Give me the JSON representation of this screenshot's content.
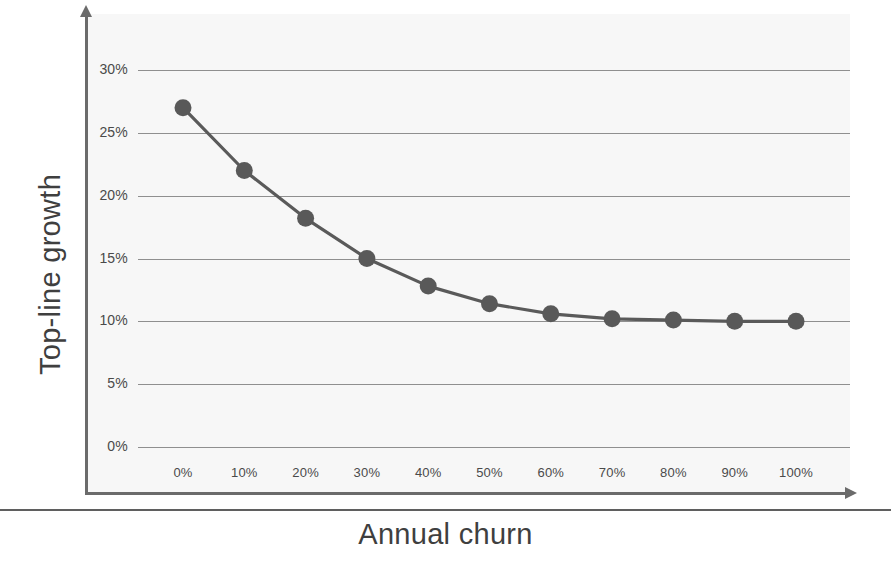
{
  "chart_data": {
    "type": "line",
    "title": "",
    "xlabel": "Annual churn",
    "ylabel": "Top-line growth",
    "categories": [
      "0%",
      "10%",
      "20%",
      "30%",
      "40%",
      "50%",
      "60%",
      "70%",
      "80%",
      "90%",
      "100%"
    ],
    "x": [
      0,
      10,
      20,
      30,
      40,
      50,
      60,
      70,
      80,
      90,
      100
    ],
    "values": [
      27.0,
      22.0,
      18.2,
      15.0,
      12.8,
      11.4,
      10.6,
      10.2,
      10.1,
      10.0,
      10.0
    ],
    "xlim": [
      0,
      100
    ],
    "ylim": [
      0,
      30
    ],
    "ytick_labels": [
      "0%",
      "5%",
      "10%",
      "15%",
      "20%",
      "25%",
      "30%"
    ],
    "ytick_values": [
      0,
      5,
      10,
      15,
      20,
      25,
      30
    ],
    "grid": "horizontal",
    "legend": "none",
    "series": [
      {
        "name": "Top-line growth vs annual churn",
        "values": [
          27.0,
          22.0,
          18.2,
          15.0,
          12.8,
          11.4,
          10.6,
          10.2,
          10.1,
          10.0,
          10.0
        ]
      }
    ]
  },
  "style": {
    "line_color": "#5a5a5a",
    "marker_color": "#595959",
    "grid_color": "#8f8f8f",
    "axis_color": "#6b6b6b",
    "panel_background": "#f7f7f7",
    "figure_background": "#ffffff",
    "tick_text_color": "#4a4a4a",
    "title_text_color": "#3f3f3f"
  }
}
